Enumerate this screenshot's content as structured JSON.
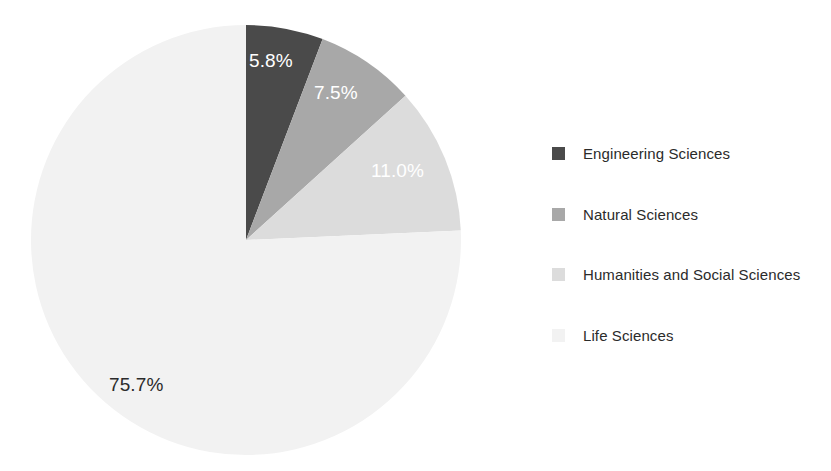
{
  "chart_data": {
    "type": "pie",
    "title": "",
    "subtitle": "",
    "xlabel": "",
    "ylabel": "",
    "legend_position": "right",
    "grid": false,
    "start_angle_deg": 0,
    "direction": "clockwise",
    "categories": [
      "Engineering Sciences",
      "Natural Sciences",
      "Humanities and Social Sciences",
      "Life Sciences"
    ],
    "values": [
      5.8,
      7.5,
      11.0,
      75.7
    ],
    "value_labels": [
      "5.8%",
      "7.5%",
      "11.0%",
      "75.7%"
    ],
    "colors": [
      "#4a4a4a",
      "#a8a8a8",
      "#dcdcdc",
      "#f2f2f2"
    ],
    "label_text_colors": [
      "#ffffff",
      "#ffffff",
      "#ffffff",
      "#2b2b2b"
    ],
    "slices": [
      {
        "name": "Engineering Sciences",
        "value": 5.8,
        "label": "5.8%",
        "color": "#4a4a4a",
        "label_color": "#ffffff",
        "label_placement": "inside"
      },
      {
        "name": "Natural Sciences",
        "value": 7.5,
        "label": "7.5%",
        "color": "#a8a8a8",
        "label_color": "#ffffff",
        "label_placement": "inside"
      },
      {
        "name": "Humanities and Social Sciences",
        "value": 11.0,
        "label": "11.0%",
        "color": "#dcdcdc",
        "label_color": "#ffffff",
        "label_placement": "inside"
      },
      {
        "name": "Life Sciences",
        "value": 75.7,
        "label": "75.7%",
        "color": "#f2f2f2",
        "label_color": "#2b2b2b",
        "label_placement": "inside"
      }
    ]
  },
  "pie": {
    "center_x": 246,
    "center_y": 240,
    "radius": 215,
    "labels": {
      "engineering": "5.8%",
      "natural": "7.5%",
      "humanities": "11.0%",
      "life": "75.7%"
    }
  },
  "legend": {
    "items": [
      {
        "label": "Engineering Sciences",
        "color": "#4a4a4a"
      },
      {
        "label": "Natural Sciences",
        "color": "#a8a8a8"
      },
      {
        "label": "Humanities and Social Sciences",
        "color": "#dcdcdc"
      },
      {
        "label": "Life Sciences",
        "color": "#f2f2f2"
      }
    ]
  }
}
